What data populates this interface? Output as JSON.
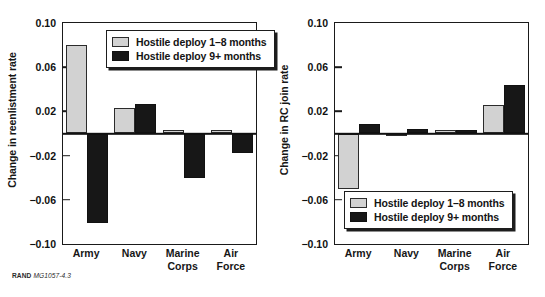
{
  "figure": {
    "source_prefix": "RAND",
    "source_id": "MG1057-4.3"
  },
  "legend": {
    "series": [
      {
        "label": "Hostile deploy 1–8 months",
        "color": "#d2d2d2",
        "key": "light"
      },
      {
        "label": "Hostile deploy 9+ months",
        "color": "#171717",
        "key": "dark"
      }
    ]
  },
  "chart_data": [
    {
      "type": "bar",
      "title": "",
      "panel": "left",
      "xlabel": "",
      "ylabel": "Change in reenlistment rate",
      "categories": [
        "Army",
        "Navy",
        "Marine Corps",
        "Air Force"
      ],
      "series": [
        {
          "name": "Hostile deploy 1–8 months",
          "color": "#d2d2d2",
          "values": [
            0.08,
            0.023,
            0.003,
            0.003
          ]
        },
        {
          "name": "Hostile deploy 9+ months",
          "color": "#171717",
          "values": [
            -0.081,
            0.027,
            -0.04,
            -0.018
          ]
        }
      ],
      "ylim": [
        -0.1,
        0.1
      ],
      "yticks": [
        0.1,
        0.06,
        0.02,
        -0.02,
        -0.06,
        -0.1
      ],
      "ytick_labels": [
        "0.10",
        "0.06",
        "0.02",
        "−0.02",
        "−0.06",
        "−0.10"
      ],
      "grid": false,
      "legend_position": "top-right-inside"
    },
    {
      "type": "bar",
      "title": "",
      "panel": "right",
      "xlabel": "",
      "ylabel": "Change in RC join rate",
      "categories": [
        "Army",
        "Navy",
        "Marine Corps",
        "Air Force"
      ],
      "series": [
        {
          "name": "Hostile deploy 1–8 months",
          "color": "#d2d2d2",
          "values": [
            -0.05,
            0.0,
            0.003,
            0.026
          ]
        },
        {
          "name": "Hostile deploy 9+ months",
          "color": "#171717",
          "values": [
            0.009,
            0.004,
            0.003,
            0.044
          ]
        }
      ],
      "ylim": [
        -0.1,
        0.1
      ],
      "yticks": [
        0.1,
        0.06,
        0.02,
        -0.02,
        -0.06,
        -0.1
      ],
      "ytick_labels": [
        "0.10",
        "0.06",
        "0.02",
        "−0.02",
        "−0.06",
        "−0.10"
      ],
      "grid": false,
      "legend_position": "bottom-right-inside"
    }
  ]
}
